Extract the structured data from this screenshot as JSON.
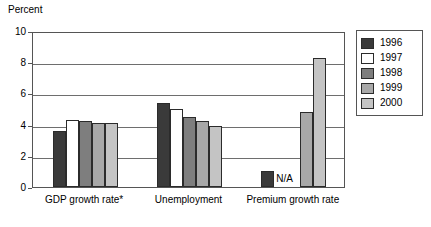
{
  "chart_data": {
    "type": "bar",
    "title": "",
    "subtitle": "",
    "xlabel": "",
    "ylabel": "Percent",
    "ylim": [
      0,
      10
    ],
    "yticks": [
      0,
      2,
      4,
      6,
      8,
      10
    ],
    "grid": true,
    "legend_position": "right",
    "categories": [
      "GDP growth rate*",
      "Unemployment",
      "Premium growth rate"
    ],
    "series": [
      {
        "name": "1996",
        "color": "#3a3a3a",
        "values": [
          3.6,
          5.4,
          1.0
        ]
      },
      {
        "name": "1997",
        "color": "#ffffff",
        "values": [
          4.3,
          5.0,
          null
        ]
      },
      {
        "name": "1998",
        "color": "#7e7e7e",
        "values": [
          4.2,
          4.5,
          null
        ]
      },
      {
        "name": "1999",
        "color": "#a8a8a8",
        "values": [
          4.1,
          4.2,
          4.8
        ]
      },
      {
        "name": "2000",
        "color": "#c4c4c4",
        "values": [
          4.1,
          3.9,
          8.3
        ]
      }
    ],
    "annotations": [
      {
        "text": "N/A",
        "category": "Premium growth rate",
        "note": "marks missing 1997 and 1998 values"
      }
    ]
  },
  "legend": {
    "entries": [
      {
        "label": "1996"
      },
      {
        "label": "1997"
      },
      {
        "label": "1998"
      },
      {
        "label": "1999"
      },
      {
        "label": "2000"
      }
    ]
  },
  "axis": {
    "y_title": "Percent",
    "y_tick_labels": [
      "10",
      "8",
      "6",
      "4",
      "2",
      "0"
    ],
    "x_tick_labels": [
      "GDP growth rate*",
      "Unemployment",
      "Premium growth rate"
    ]
  },
  "annotation": {
    "na_text": "N/A"
  }
}
